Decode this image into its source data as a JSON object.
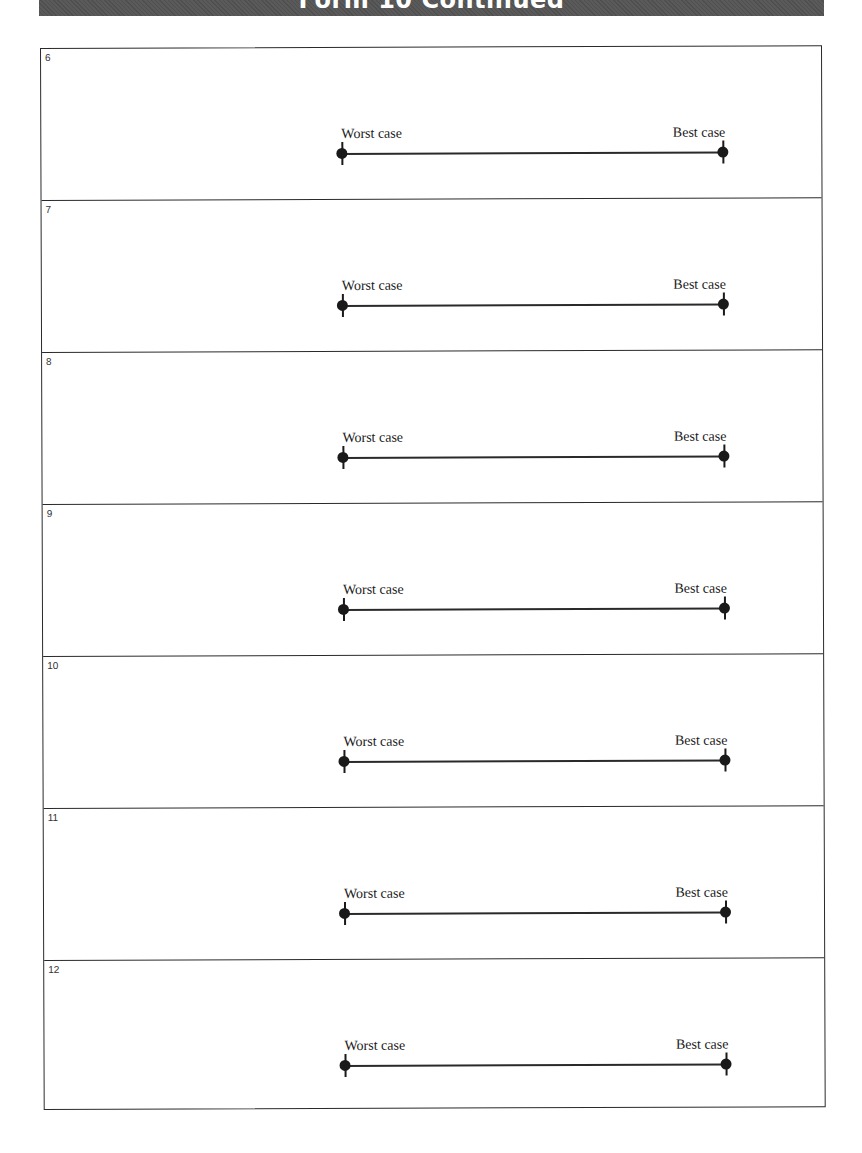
{
  "header": {
    "title": "Form 10  Continued"
  },
  "scale_labels": {
    "worst": "Worst case",
    "best": "Best case"
  },
  "rows": [
    {
      "number": "6",
      "worst_label": "Worst case",
      "best_label": "Best case"
    },
    {
      "number": "7",
      "worst_label": "Worst case",
      "best_label": "Best case"
    },
    {
      "number": "8",
      "worst_label": "Worst case",
      "best_label": "Best case"
    },
    {
      "number": "9",
      "worst_label": "Worst case",
      "best_label": "Best case"
    },
    {
      "number": "10",
      "worst_label": "Worst case",
      "best_label": "Best case"
    },
    {
      "number": "11",
      "worst_label": "Worst case",
      "best_label": "Best case"
    },
    {
      "number": "12",
      "worst_label": "Worst case",
      "best_label": "Best case"
    }
  ],
  "colors": {
    "header_bg": "#5a5a5a",
    "ink": "#1a1a1a"
  }
}
